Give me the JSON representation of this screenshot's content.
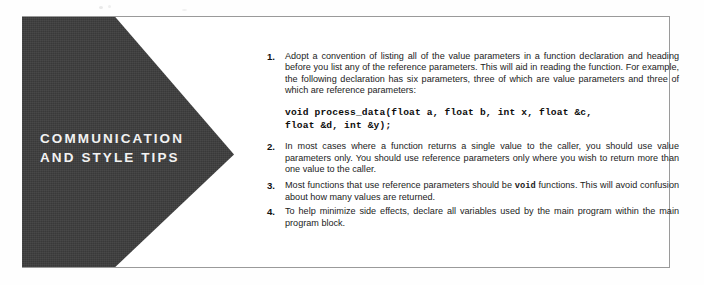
{
  "callout": {
    "panel_label": "COMMUNICATION\nAND STYLE TIPS",
    "panel_color": "#3c3c3c",
    "panel_text_color": "#f2f2f2",
    "border_color": "#9a9a9a",
    "background_color": "#ffffff"
  },
  "tips": [
    {
      "number": "1.",
      "text": "Adopt a convention of listing all of the value parameters in a function declaration and heading before you list any of the reference parameters. This will aid in reading the function. For example, the following declaration has six parameters, three of which are value parameters and three of which are reference parameters:"
    },
    {
      "number": "2.",
      "text": "In most cases where a function returns a single value to the caller, you should use value parameters only. You should use reference parameters only where you wish to return more than one value to the caller."
    },
    {
      "number": "3.",
      "text_before": "Most functions that use reference parameters should be ",
      "code": "void",
      "text_after": " functions. This will avoid confusion about how many values are returned."
    },
    {
      "number": "4.",
      "text": "To help minimize side effects, declare all variables used by the main program within the main program block."
    }
  ],
  "code_sample": {
    "line_1": "void process_data(float a, float b, int x, float &c,",
    "line_2": "float &d, int &y);"
  }
}
